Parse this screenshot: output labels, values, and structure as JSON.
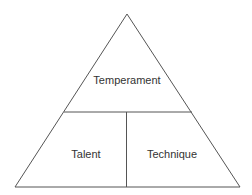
{
  "diagram": {
    "type": "pyramid",
    "top_section": {
      "label": "Temperament"
    },
    "bottom_left_section": {
      "label": "Talent"
    },
    "bottom_right_section": {
      "label": "Technique"
    },
    "line_color": "#555555",
    "background": "#ffffff"
  }
}
